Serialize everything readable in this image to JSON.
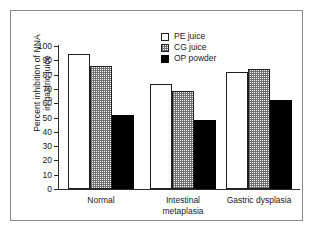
{
  "chart_data": {
    "type": "bar",
    "title": "",
    "subtitle": "",
    "xlabel": "",
    "ylabel_line1": "Percent inhibition of NNA",
    "ylabel_line2": "in gastric juice",
    "categories": [
      "Normal",
      "Intestinal metaplasia",
      "Gastric dysplasia"
    ],
    "category_lines": [
      [
        "Normal"
      ],
      [
        "Intestinal",
        "metaplasia"
      ],
      [
        "Gastric dysplasia"
      ]
    ],
    "series": [
      {
        "name": "PE juice",
        "values": [
          94.5,
          73.5,
          82.0
        ],
        "fill": "white",
        "color": "#ffffff"
      },
      {
        "name": "CG juice",
        "values": [
          86.0,
          68.5,
          84.0
        ],
        "fill": "stipple",
        "color": "#d9d9d9"
      },
      {
        "name": "OP powder",
        "values": [
          52.0,
          48.5,
          62.5
        ],
        "fill": "solid",
        "color": "#000000"
      }
    ],
    "ylim": [
      0,
      100
    ],
    "yticks": [
      0,
      10,
      20,
      30,
      40,
      50,
      60,
      70,
      80,
      90,
      100
    ],
    "ytick_labels": [
      "0",
      "10",
      "20",
      "30",
      "40",
      "50",
      "60",
      "70",
      "80",
      "90",
      "100"
    ],
    "grid": false,
    "legend_position": "top-center",
    "legend_entries": [
      "PE juice",
      "CG juice",
      "OP powder"
    ],
    "axis_color": "#2b2b2b",
    "frame_color": "#8a8a8a",
    "background": "#ffffff"
  }
}
